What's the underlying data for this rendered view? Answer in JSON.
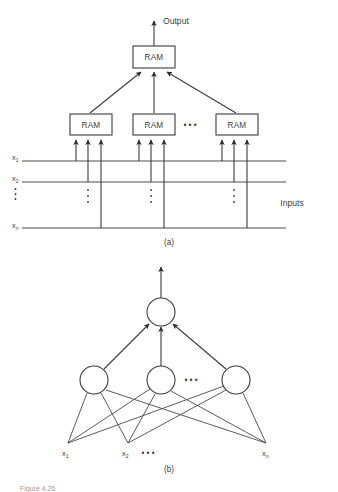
{
  "figure": {
    "panel_a": {
      "label": "(a)",
      "output_label": "Output",
      "inputs_label": "Inputs",
      "node_label": "RAM",
      "top_node": {
        "label": "RAM"
      },
      "hidden_nodes": [
        {
          "label": "RAM"
        },
        {
          "label": "RAM"
        },
        {
          "label": "RAM"
        }
      ],
      "ellipsis": "• • •",
      "input_lines": [
        {
          "name": "x1",
          "base": "x",
          "sub": "1"
        },
        {
          "name": "x2",
          "base": "x",
          "sub": "2"
        },
        {
          "name": "xn",
          "base": "x",
          "sub": "n"
        }
      ],
      "vertical_ellipsis": "⋮"
    },
    "panel_b": {
      "label": "(b)",
      "hidden_nodes_count": 3,
      "ellipsis": "• • •",
      "inputs": [
        {
          "name": "x1",
          "base": "x",
          "sub": "1"
        },
        {
          "name": "x2",
          "base": "x",
          "sub": "2"
        },
        {
          "name": "xn",
          "base": "x",
          "sub": "n"
        }
      ],
      "input_ellipsis": "• • •"
    },
    "caption": "Figure  4.26"
  },
  "colors": {
    "line": "#3b3b3b",
    "bus": "#4d4d4d",
    "text": "#404040",
    "background": "#ffffff",
    "caption": "#9a9a9a"
  }
}
